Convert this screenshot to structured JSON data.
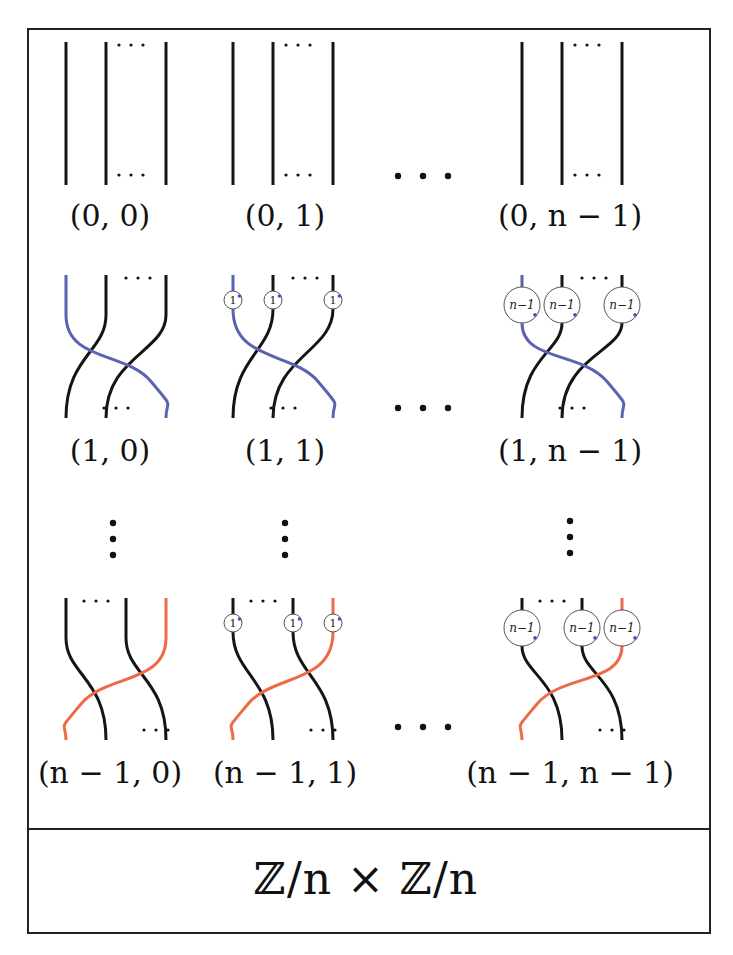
{
  "figure": {
    "group_label": "ℤ/n × ℤ/n",
    "colors": {
      "strand": "#151515",
      "blue_strand": "#5b63b0",
      "orange_strand": "#ee6a45",
      "coupon_dot": "#4a4fc0",
      "frame": "#222222"
    },
    "columns": [
      {
        "key": "0",
        "coupon": ""
      },
      {
        "key": "1",
        "coupon": "1"
      },
      {
        "key": "n-1",
        "coupon": "n−1"
      }
    ],
    "column_ellipsis": "• • •",
    "row_ellipsis": "⋮",
    "cells": [
      {
        "row": 0,
        "col": 0,
        "label": "(0, 0)",
        "twist": "none",
        "coupon": ""
      },
      {
        "row": 0,
        "col": 1,
        "label": "(0, 1)",
        "twist": "none",
        "coupon": "1"
      },
      {
        "row": 0,
        "col": 2,
        "label": "(0, n − 1)",
        "twist": "none",
        "coupon": "n−1"
      },
      {
        "row": 1,
        "col": 0,
        "label": "(1, 0)",
        "twist": "blue",
        "coupon": ""
      },
      {
        "row": 1,
        "col": 1,
        "label": "(1, 1)",
        "twist": "blue",
        "coupon": "1"
      },
      {
        "row": 1,
        "col": 2,
        "label": "(1, n − 1)",
        "twist": "blue",
        "coupon": "n−1"
      },
      {
        "row": 2,
        "col": 0,
        "label": "(n − 1, 0)",
        "twist": "orange",
        "coupon": ""
      },
      {
        "row": 2,
        "col": 1,
        "label": "(n − 1, 1)",
        "twist": "orange",
        "coupon": "1"
      },
      {
        "row": 2,
        "col": 2,
        "label": "(n − 1, n − 1)",
        "twist": "orange",
        "coupon": "n−1"
      }
    ]
  }
}
